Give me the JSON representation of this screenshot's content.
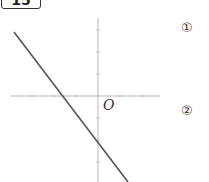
{
  "problem": {
    "number": "15"
  },
  "graph": {
    "origin_label": "O",
    "x_axis": {
      "from": [
        10,
        96
      ],
      "to": [
        160,
        96
      ],
      "color": "#b5b5b5"
    },
    "y_axis": {
      "from": [
        98,
        18
      ],
      "to": [
        98,
        182
      ],
      "color": "#b5b5b5"
    },
    "tick_spacing_px": 22,
    "line": {
      "from": [
        14,
        32
      ],
      "to": [
        128,
        182
      ],
      "color": "#555555",
      "slope_sign": "negative",
      "y_intercept_sign": "negative"
    }
  },
  "sub_questions": [
    {
      "label": "①"
    },
    {
      "label": "②"
    }
  ]
}
